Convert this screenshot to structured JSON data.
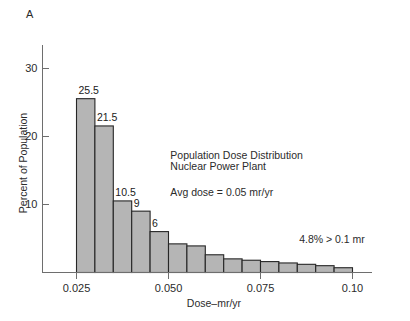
{
  "panel": {
    "label": "A"
  },
  "chart_data": {
    "type": "bar",
    "title": "",
    "xlabel": "Dose–mr/yr",
    "ylabel": "Percent of Population",
    "xlim": [
      0.0225,
      0.1015
    ],
    "ylim": [
      0,
      34
    ],
    "grid": false,
    "legend": null,
    "bin_width": 0.005,
    "categories": [
      "0.025–0.030",
      "0.030–0.035",
      "0.035–0.040",
      "0.040–0.045",
      "0.045–0.050",
      "0.050–0.055",
      "0.055–0.060",
      "0.060–0.065",
      "0.065–0.070",
      "0.070–0.075",
      "0.075–0.080",
      "0.080–0.085",
      "0.085–0.090",
      "0.090–0.095",
      "0.095–0.100"
    ],
    "bin_starts": [
      0.025,
      0.03,
      0.035,
      0.04,
      0.045,
      0.05,
      0.055,
      0.06,
      0.065,
      0.07,
      0.075,
      0.08,
      0.085,
      0.09,
      0.095
    ],
    "values": [
      25.5,
      21.5,
      10.5,
      9,
      6,
      4.2,
      3.9,
      2.6,
      2.0,
      1.8,
      1.6,
      1.4,
      1.2,
      1.0,
      0.7
    ],
    "bar_labels": [
      "25.5",
      "21.5",
      "10.5",
      "9",
      "6",
      "",
      "",
      "",
      "",
      "",
      "",
      "",
      "",
      "",
      ""
    ],
    "bar_fill": "#b5b5b5",
    "bar_stroke": "#262626",
    "x_ticks": [
      {
        "value": 0.025,
        "label": "0.025"
      },
      {
        "value": 0.05,
        "label": "0.050"
      },
      {
        "value": 0.075,
        "label": "0.075"
      },
      {
        "value": 0.1,
        "label": "0.10"
      }
    ],
    "y_ticks": [
      {
        "value": 10,
        "label": "10"
      },
      {
        "value": 20,
        "label": "20"
      },
      {
        "value": 30,
        "label": "30"
      }
    ],
    "annotations": [
      {
        "name": "distribution-title-line1",
        "text": "Population Dose Distribution",
        "x": 0.0505,
        "y": 16.7
      },
      {
        "name": "distribution-title-line2",
        "text": "Nuclear Power Plant",
        "x": 0.0505,
        "y": 15.0
      },
      {
        "name": "avg-dose-note",
        "text": "Avg dose = 0.05 mr/yr",
        "x": 0.0505,
        "y": 11.2
      },
      {
        "name": "tail-percent-note",
        "text": "4.8% > 0.1 mr",
        "x": 0.0855,
        "y": 4.4
      }
    ]
  }
}
